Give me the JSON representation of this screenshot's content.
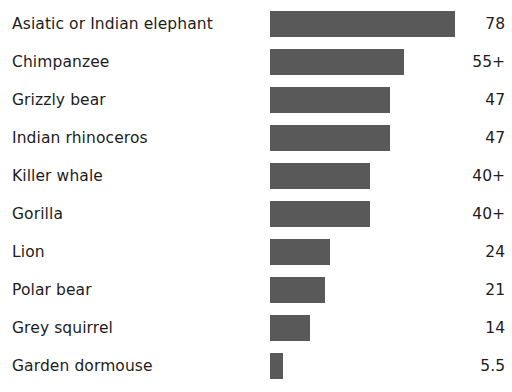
{
  "chart_data": {
    "type": "bar",
    "orientation": "horizontal",
    "title": "",
    "subtitle": "",
    "xlabel": "",
    "ylabel": "",
    "grid": false,
    "legend": false,
    "axis_visible": false,
    "value_labels_shown": true,
    "bar_color": "#595959",
    "text_color": "#1d1d1d",
    "background_color": "#ffffff",
    "xlim": [
      0,
      78
    ],
    "categories": [
      "Asiatic or Indian elephant",
      "Chimpanzee",
      "Grizzly bear",
      "Indian rhinoceros",
      "Killer whale",
      "Gorilla",
      "Lion",
      "Polar bear",
      "Grey squirrel",
      "Garden dormouse"
    ],
    "values": [
      78,
      55,
      47,
      47,
      40,
      40,
      24,
      21,
      14,
      5.5
    ],
    "value_labels": [
      "78",
      "55+",
      "47",
      "47",
      "40+",
      "40+",
      "24",
      "21",
      "14",
      "5.5"
    ],
    "bar_pixel_widths": [
      185,
      134,
      120,
      120,
      100,
      100,
      60,
      55,
      40,
      13
    ]
  },
  "rows": [
    {
      "label": "Asiatic or Indian elephant",
      "value_label": "78",
      "width_px": 185
    },
    {
      "label": "Chimpanzee",
      "value_label": "55+",
      "width_px": 134
    },
    {
      "label": "Grizzly bear",
      "value_label": "47",
      "width_px": 120
    },
    {
      "label": "Indian rhinoceros",
      "value_label": "47",
      "width_px": 120
    },
    {
      "label": "Killer whale",
      "value_label": "40+",
      "width_px": 100
    },
    {
      "label": "Gorilla",
      "value_label": "40+",
      "width_px": 100
    },
    {
      "label": "Lion",
      "value_label": "24",
      "width_px": 60
    },
    {
      "label": "Polar bear",
      "value_label": "21",
      "width_px": 55
    },
    {
      "label": "Grey squirrel",
      "value_label": "14",
      "width_px": 40
    },
    {
      "label": "Garden dormouse",
      "value_label": "5.5",
      "width_px": 13
    }
  ]
}
